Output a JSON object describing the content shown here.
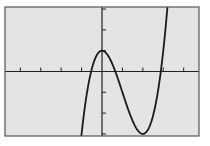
{
  "chart_data": {
    "type": "line",
    "title": "",
    "xlabel": "",
    "ylabel": "",
    "function": "y = x^3 - 3x^2 + 1",
    "coefficients": [
      1,
      -3,
      0,
      1
    ],
    "xlim": [
      -4.75,
      4.75
    ],
    "ylim": [
      -3.1,
      3.1
    ],
    "x_tick_step": 1,
    "y_tick_step": 1,
    "grid": false,
    "legend": null,
    "key_points": {
      "local_max": [
        0,
        1
      ],
      "local_min": [
        2,
        -3
      ],
      "roots": [
        -0.53,
        0.65,
        2.88
      ],
      "exits_bottom_at_x": -1
    },
    "series": [
      {
        "name": "cubic",
        "x": [
          -1.0,
          -0.75,
          -0.5,
          -0.25,
          0.0,
          0.25,
          0.5,
          0.75,
          1.0,
          1.25,
          1.5,
          1.75,
          2.0,
          2.25,
          2.5,
          2.75,
          3.0,
          3.25,
          3.5
        ],
        "y": [
          -3.0,
          -1.109,
          0.125,
          0.797,
          1.0,
          0.828,
          0.375,
          -0.266,
          -1.0,
          -1.734,
          -2.375,
          -2.828,
          -3.0,
          -2.797,
          -2.125,
          -0.891,
          1.0,
          3.641,
          7.125
        ]
      }
    ]
  },
  "colors": {
    "page_background": "#ffffff",
    "plot_background": "#e4e4e4",
    "frame": "#555555",
    "axes": "#222222",
    "curve": "#1a1a1a"
  }
}
